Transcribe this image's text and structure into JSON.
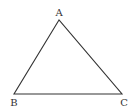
{
  "diagram": {
    "type": "triangle",
    "stroke_color": "#333333",
    "vertices": [
      {
        "label": "A",
        "x": 59,
        "y": 20
      },
      {
        "label": "B",
        "x": 14,
        "y": 94
      },
      {
        "label": "C",
        "x": 122,
        "y": 94
      }
    ],
    "labels": {
      "A": "A",
      "B": "B",
      "C": "C"
    }
  }
}
